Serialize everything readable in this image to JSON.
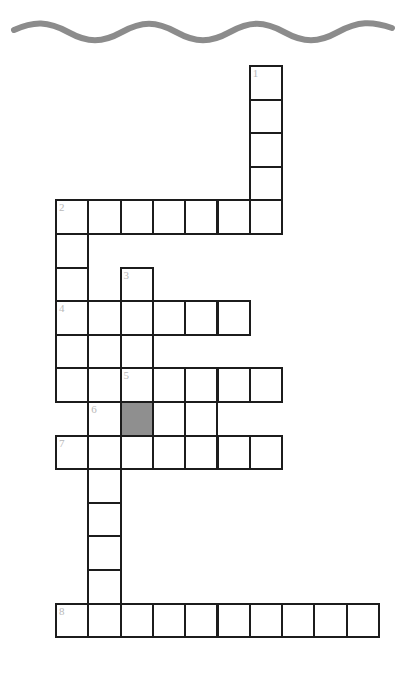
{
  "puzzle": {
    "title": "Crossword Puzzle Grid",
    "decoration": {
      "name": "wavy-line",
      "color": "#8c8c8c",
      "stroke_width": 6
    },
    "geometry": {
      "origin_x": 55,
      "origin_y": 65,
      "cell_width": 32.3,
      "cell_height": 33.6,
      "border_color": "#1c1c1c",
      "border_width": 2,
      "shaded_color": "#8f8f8f",
      "number_color": "#b9b9b9",
      "columns": 10,
      "rows": 17
    },
    "numbers": [
      "1",
      "2",
      "3",
      "4",
      "5",
      "6",
      "7",
      "8"
    ],
    "entries": [
      {
        "number": "1",
        "direction": "down",
        "row": 0,
        "col": 6,
        "length": 5
      },
      {
        "number": "2",
        "direction": "across",
        "row": 4,
        "col": 0,
        "length": 7
      },
      {
        "number": "3",
        "direction": "down",
        "row": 6,
        "col": 2,
        "length": 3
      },
      {
        "number": "4",
        "direction": "across",
        "row": 7,
        "col": 0,
        "length": 6
      },
      {
        "number": "5",
        "direction": "across",
        "row": 9,
        "col": 2,
        "length": 5
      },
      {
        "number": "6",
        "direction": "across",
        "row": 10,
        "col": 1,
        "length": 4
      },
      {
        "number": "7",
        "direction": "across",
        "row": 11,
        "col": 0,
        "length": 7
      },
      {
        "number": "8",
        "direction": "across",
        "row": 16,
        "col": 0,
        "length": 10
      }
    ],
    "cells": [
      {
        "row": 0,
        "col": 6,
        "number": "1",
        "shaded": false
      },
      {
        "row": 1,
        "col": 6,
        "number": "",
        "shaded": false
      },
      {
        "row": 2,
        "col": 6,
        "number": "",
        "shaded": false
      },
      {
        "row": 3,
        "col": 6,
        "number": "",
        "shaded": false
      },
      {
        "row": 4,
        "col": 0,
        "number": "2",
        "shaded": false
      },
      {
        "row": 4,
        "col": 1,
        "number": "",
        "shaded": false
      },
      {
        "row": 4,
        "col": 2,
        "number": "",
        "shaded": false
      },
      {
        "row": 4,
        "col": 3,
        "number": "",
        "shaded": false
      },
      {
        "row": 4,
        "col": 4,
        "number": "",
        "shaded": false
      },
      {
        "row": 4,
        "col": 5,
        "number": "",
        "shaded": false
      },
      {
        "row": 4,
        "col": 6,
        "number": "",
        "shaded": false
      },
      {
        "row": 5,
        "col": 0,
        "number": "",
        "shaded": false
      },
      {
        "row": 6,
        "col": 0,
        "number": "",
        "shaded": false
      },
      {
        "row": 6,
        "col": 2,
        "number": "3",
        "shaded": false
      },
      {
        "row": 7,
        "col": 0,
        "number": "4",
        "shaded": false
      },
      {
        "row": 7,
        "col": 1,
        "number": "",
        "shaded": false
      },
      {
        "row": 7,
        "col": 2,
        "number": "",
        "shaded": false
      },
      {
        "row": 7,
        "col": 3,
        "number": "",
        "shaded": false
      },
      {
        "row": 7,
        "col": 4,
        "number": "",
        "shaded": false
      },
      {
        "row": 7,
        "col": 5,
        "number": "",
        "shaded": false
      },
      {
        "row": 8,
        "col": 0,
        "number": "",
        "shaded": false
      },
      {
        "row": 8,
        "col": 1,
        "number": "",
        "shaded": false
      },
      {
        "row": 8,
        "col": 2,
        "number": "",
        "shaded": false
      },
      {
        "row": 9,
        "col": 0,
        "number": "",
        "shaded": false
      },
      {
        "row": 9,
        "col": 1,
        "number": "",
        "shaded": false
      },
      {
        "row": 9,
        "col": 2,
        "number": "5",
        "shaded": false
      },
      {
        "row": 9,
        "col": 3,
        "number": "",
        "shaded": false
      },
      {
        "row": 9,
        "col": 4,
        "number": "",
        "shaded": false
      },
      {
        "row": 9,
        "col": 5,
        "number": "",
        "shaded": false
      },
      {
        "row": 9,
        "col": 6,
        "number": "",
        "shaded": false
      },
      {
        "row": 10,
        "col": 1,
        "number": "6",
        "shaded": false
      },
      {
        "row": 10,
        "col": 2,
        "number": "",
        "shaded": true
      },
      {
        "row": 10,
        "col": 3,
        "number": "",
        "shaded": false
      },
      {
        "row": 10,
        "col": 4,
        "number": "",
        "shaded": false
      },
      {
        "row": 11,
        "col": 0,
        "number": "7",
        "shaded": false
      },
      {
        "row": 11,
        "col": 1,
        "number": "",
        "shaded": false
      },
      {
        "row": 11,
        "col": 2,
        "number": "",
        "shaded": false
      },
      {
        "row": 11,
        "col": 3,
        "number": "",
        "shaded": false
      },
      {
        "row": 11,
        "col": 4,
        "number": "",
        "shaded": false
      },
      {
        "row": 11,
        "col": 5,
        "number": "",
        "shaded": false
      },
      {
        "row": 11,
        "col": 6,
        "number": "",
        "shaded": false
      },
      {
        "row": 12,
        "col": 1,
        "number": "",
        "shaded": false
      },
      {
        "row": 13,
        "col": 1,
        "number": "",
        "shaded": false
      },
      {
        "row": 14,
        "col": 1,
        "number": "",
        "shaded": false
      },
      {
        "row": 15,
        "col": 1,
        "number": "",
        "shaded": false
      },
      {
        "row": 16,
        "col": 0,
        "number": "8",
        "shaded": false
      },
      {
        "row": 16,
        "col": 1,
        "number": "",
        "shaded": false
      },
      {
        "row": 16,
        "col": 2,
        "number": "",
        "shaded": false
      },
      {
        "row": 16,
        "col": 3,
        "number": "",
        "shaded": false
      },
      {
        "row": 16,
        "col": 4,
        "number": "",
        "shaded": false
      },
      {
        "row": 16,
        "col": 5,
        "number": "",
        "shaded": false
      },
      {
        "row": 16,
        "col": 6,
        "number": "",
        "shaded": false
      },
      {
        "row": 16,
        "col": 7,
        "number": "",
        "shaded": false
      },
      {
        "row": 16,
        "col": 8,
        "number": "",
        "shaded": false
      },
      {
        "row": 16,
        "col": 9,
        "number": "",
        "shaded": false
      }
    ]
  }
}
